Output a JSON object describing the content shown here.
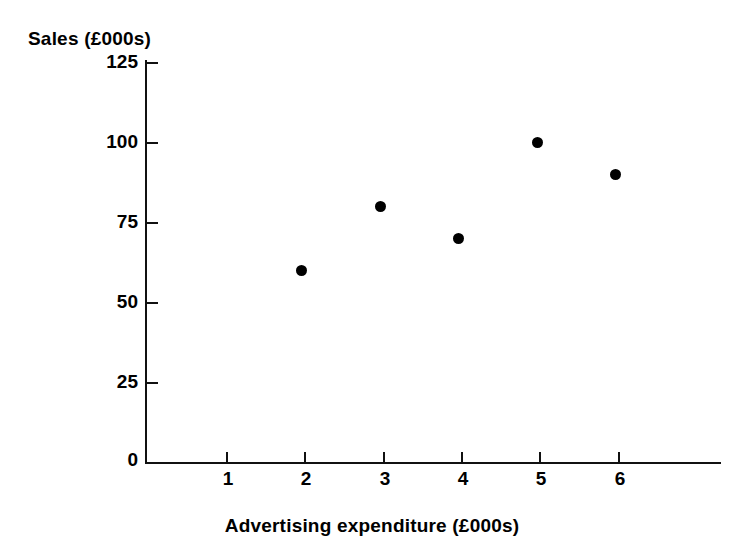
{
  "chart_data": {
    "type": "scatter",
    "title": "",
    "xlabel": "Advertising expenditure (£000s)",
    "ylabel": "Sales (£000s)",
    "x": [
      2,
      3,
      4,
      5,
      6
    ],
    "values": [
      60,
      80,
      70,
      100,
      90
    ],
    "points": [
      {
        "x": 2,
        "y": 60
      },
      {
        "x": 3,
        "y": 80
      },
      {
        "x": 4,
        "y": 70
      },
      {
        "x": 5,
        "y": 100
      },
      {
        "x": 6,
        "y": 90
      }
    ],
    "xlim": [
      0,
      7.3
    ],
    "ylim": [
      0,
      125
    ],
    "xticks": [
      1,
      2,
      3,
      4,
      5,
      6
    ],
    "yticks": [
      0,
      25,
      50,
      75,
      100,
      125
    ],
    "xtick_labels": [
      "1",
      "2",
      "3",
      "4",
      "5",
      "6"
    ],
    "ytick_labels": [
      "0",
      "25",
      "50",
      "75",
      "100",
      "125"
    ],
    "grid": false,
    "legend": null,
    "legend_position": "none",
    "marker": "filled-circle",
    "marker_color": "#000000",
    "axis_color": "#111111",
    "background": "#ffffff"
  },
  "axes": {
    "y_title": "Sales (£000s)",
    "x_title": "Advertising expenditure (£000s)"
  }
}
